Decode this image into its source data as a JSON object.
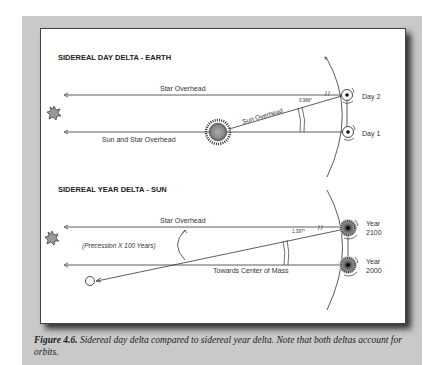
{
  "figure": {
    "panels": [
      {
        "title": "SIDEREAL DAY DELTA - EARTH",
        "labels": {
          "top_line": "Star Overhead",
          "bottom_line": "Sun and Star Overhead",
          "diagonal": "Sun Overhead",
          "angle": "0.986°",
          "position_top": "Day 2",
          "position_bottom": "Day 1"
        },
        "icons": [
          "star-icon",
          "sun-icon",
          "earth-icon"
        ]
      },
      {
        "title": "SIDEREAL YEAR DELTA - SUN",
        "labels": {
          "top_line": "Star Overhead",
          "bottom_line": "Towards Center of Mass",
          "annotation": "(Precession X 100 Years)",
          "angle": "1.397°",
          "position_top_line1": "Year",
          "position_top_line2": "2100",
          "position_bottom_line1": "Year",
          "position_bottom_line2": "2000"
        },
        "icons": [
          "star-icon",
          "companion-body-icon",
          "sun-icon"
        ]
      }
    ],
    "caption": {
      "label": "Figure 4.6.",
      "text": " Sidereal day delta compared to sidereal year delta.  Note that both deltas account for orbits."
    }
  }
}
